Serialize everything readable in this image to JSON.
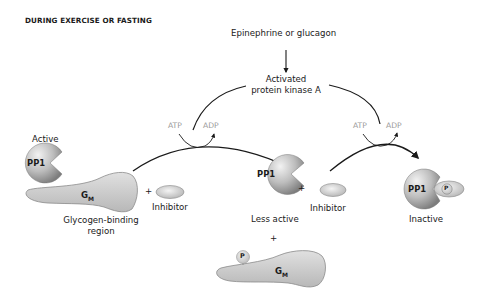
{
  "title": "DURING EXERCISE OR FASTING",
  "signal": "Epinephrine or glucagon",
  "kinase": {
    "line1": "Activated",
    "line2": "protein kinase A"
  },
  "reaction1": {
    "atp": "ATP",
    "adp": "ADP"
  },
  "reaction2": {
    "atp": "ATP",
    "adp": "ADP"
  },
  "state_active": {
    "label": "Active",
    "enzyme": "PP1",
    "subunit": "G",
    "subunit_sub": "M",
    "region_line1": "Glycogen-binding",
    "region_line2": "region",
    "plus": "+",
    "inhibitor": "Inhibitor"
  },
  "state_less_active": {
    "enzyme": "PP1",
    "label": "Less active",
    "plus": "+",
    "inhibitor": "Inhibitor",
    "plus_below": "+",
    "phospho": "P",
    "subunit": "G",
    "subunit_sub": "M"
  },
  "state_inactive": {
    "enzyme": "PP1",
    "phospho": "P",
    "label": "Inactive"
  },
  "colors": {
    "protein_fill": "#c8c8c8",
    "protein_shadow": "#8f8f8f",
    "gm_fill": "#cfcfcf",
    "gm_stroke": "#8a8a8a",
    "arrow": "#1a1a1a",
    "muted_text": "#9a9a9a"
  }
}
